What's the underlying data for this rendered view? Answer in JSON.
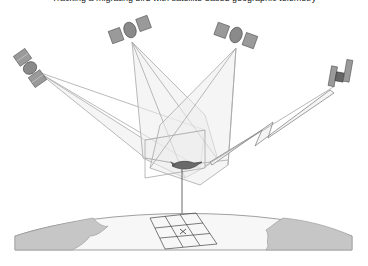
{
  "caption": {
    "text": "Tracking a migrating bird with satellite-based geographic telemetry",
    "truncated": true
  },
  "diagram": {
    "subject": "bird",
    "satellites": [
      {
        "id": "sat-left",
        "x": 30,
        "y": 68
      },
      {
        "id": "sat-top-left",
        "x": 128,
        "y": 30
      },
      {
        "id": "sat-top-right",
        "x": 237,
        "y": 38
      },
      {
        "id": "sat-right",
        "x": 340,
        "y": 78
      }
    ],
    "signal": "lightning-bolt-link",
    "ground": {
      "grid": "3x3",
      "marker": "x"
    },
    "colors": {
      "line": "#9a9a9a",
      "cone_fill": "#e8e8e8",
      "land": "#c8c8c8",
      "satellite": "#777777"
    }
  }
}
